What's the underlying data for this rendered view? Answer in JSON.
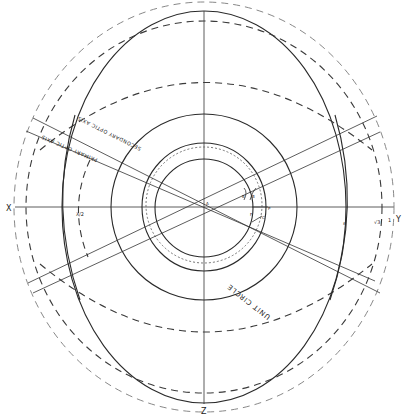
{
  "diagram": {
    "axes": {
      "x": "X",
      "y": "Y",
      "z": "Z"
    },
    "optic_axes": {
      "secondary": "SECONDARY OPTIC AXIS",
      "primary": "PRIMARY OPTIC AXIS"
    },
    "circle_label": "UNIT CIRCLE",
    "axis_marks": {
      "left_inner": "λ/2",
      "right_inner": "ε",
      "right_mid": "√3",
      "right_outer": "1"
    },
    "center_labels": [
      "A",
      "B",
      "B",
      "P",
      "C",
      "F"
    ]
  }
}
